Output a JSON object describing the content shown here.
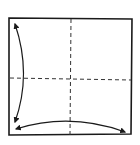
{
  "diagram": {
    "type": "origami-fold-instruction",
    "colors": {
      "background": "#ffffff",
      "stroke": "#1a1a1a",
      "fold_line": "#333333"
    },
    "square": {
      "x1": 9,
      "y1": 18,
      "x2": 132,
      "y2": 19,
      "x3": 131,
      "y3": 134,
      "x4": 9,
      "y4": 135
    },
    "fold_lines": [
      {
        "name": "vertical-center-fold",
        "style": "dashed",
        "x1": 71,
        "y1": 19,
        "x2": 70,
        "y2": 135
      },
      {
        "name": "horizontal-center-fold",
        "style": "dashed",
        "x1": 10,
        "y1": 78,
        "x2": 131,
        "y2": 80
      }
    ],
    "arrows": [
      {
        "name": "left-vertical-fold-arrow",
        "direction": "both",
        "from": [
          15,
          24
        ],
        "control": [
          32,
          74
        ],
        "to": [
          15,
          122
        ]
      },
      {
        "name": "bottom-horizontal-fold-arrow",
        "direction": "both",
        "from": [
          16,
          129
        ],
        "control": [
          70,
          112
        ],
        "to": [
          125,
          132
        ]
      }
    ],
    "labels": {
      "title": "Fold in half both ways and unfold"
    }
  }
}
